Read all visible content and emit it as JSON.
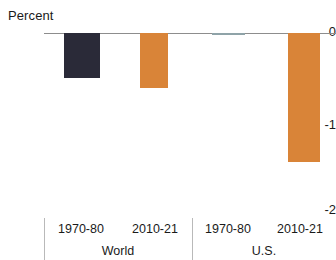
{
  "chart_data": {
    "type": "bar",
    "title": "",
    "ylabel": "Percent",
    "xlabel": "",
    "ylim": [
      -2,
      0
    ],
    "yticks": [
      0,
      -1,
      -2
    ],
    "ytick_labels": [
      "0",
      "-1",
      "-2"
    ],
    "grid": false,
    "legend": "none",
    "zero_line": true,
    "orientation": "vertical",
    "groups": [
      {
        "name": "World",
        "categories": [
          "1970-80",
          "2010-21"
        ],
        "values": [
          -0.51,
          -0.62
        ],
        "colors": [
          "#2a2a38",
          "#d98438"
        ]
      },
      {
        "name": "U.S.",
        "categories": [
          "1970-80",
          "2010-21"
        ],
        "values": [
          -0.02,
          -1.47
        ],
        "colors": [
          "#8fa3a8",
          "#d98438"
        ]
      }
    ],
    "bars": [
      {
        "id": "world-1970-80",
        "group": "World",
        "category": "1970-80",
        "value": -0.51,
        "color": "#2a2a38"
      },
      {
        "id": "world-2010-21",
        "group": "World",
        "category": "2010-21",
        "value": -0.62,
        "color": "#d98438"
      },
      {
        "id": "us-1970-80",
        "group": "U.S.",
        "category": "1970-80",
        "value": -0.02,
        "color": "#8fa3a8"
      },
      {
        "id": "us-2010-21",
        "group": "U.S.",
        "category": "2010-21",
        "value": -1.47,
        "color": "#d98438"
      }
    ]
  },
  "axis": {
    "title": "Percent",
    "tick_0": "0",
    "tick_minus1": "-1",
    "tick_minus2": "-2"
  },
  "labels": {
    "world_period_1": "1970-80",
    "world_period_2": "2010-21",
    "world_group": "World",
    "us_period_1": "1970-80",
    "us_period_2": "2010-21",
    "us_group": "U.S."
  },
  "colors": {
    "dark_navy": "#2a2a38",
    "orange": "#d98438",
    "muted_teal": "#8fa3a8",
    "axis_line": "#8d8d8d",
    "rule": "#b9b9b9",
    "text": "#1a1a1a"
  }
}
